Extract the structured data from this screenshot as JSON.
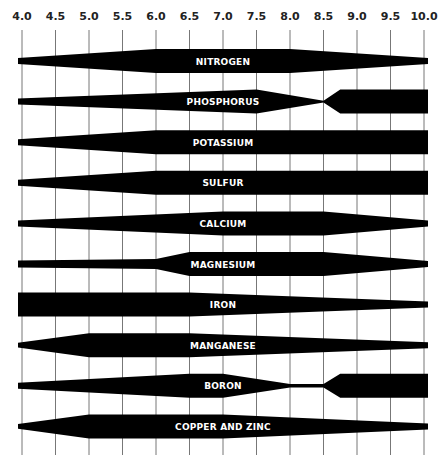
{
  "chart_data": {
    "type": "band",
    "title": "",
    "xlabel": "pH",
    "ylabel": "",
    "x_ticks": [
      "4.0",
      "4.5",
      "5.0",
      "5.5",
      "6.0",
      "6.5",
      "7.0",
      "7.5",
      "8.0",
      "8.5",
      "9.0",
      "9.5",
      "10.0"
    ],
    "xlim": [
      4.0,
      10.0
    ],
    "grid": true,
    "series": [
      {
        "name": "NITROGEN",
        "points": [
          [
            4.0,
            0.25
          ],
          [
            6.0,
            1.0
          ],
          [
            8.0,
            1.0
          ],
          [
            10.0,
            0.25
          ]
        ],
        "end_style": "tapered"
      },
      {
        "name": "PHOSPHORUS",
        "points": [
          [
            4.0,
            0.25
          ],
          [
            7.5,
            1.0
          ],
          [
            8.5,
            0.08
          ],
          [
            8.75,
            1.0
          ],
          [
            10.0,
            1.0
          ]
        ],
        "end_style": "square_right"
      },
      {
        "name": "POTASSIUM",
        "points": [
          [
            4.0,
            0.25
          ],
          [
            6.0,
            1.0
          ],
          [
            10.0,
            1.0
          ]
        ],
        "end_style": "square_right"
      },
      {
        "name": "SULFUR",
        "points": [
          [
            4.0,
            0.25
          ],
          [
            6.0,
            1.0
          ],
          [
            10.0,
            1.0
          ]
        ],
        "end_style": "square_right"
      },
      {
        "name": "CALCIUM",
        "points": [
          [
            4.0,
            0.25
          ],
          [
            7.0,
            1.0
          ],
          [
            8.5,
            1.0
          ],
          [
            10.0,
            0.25
          ]
        ],
        "end_style": "tapered"
      },
      {
        "name": "MAGNESIUM",
        "points": [
          [
            4.0,
            0.3
          ],
          [
            6.0,
            0.42
          ],
          [
            6.5,
            1.0
          ],
          [
            8.5,
            1.0
          ],
          [
            10.0,
            0.25
          ]
        ],
        "end_style": "tapered"
      },
      {
        "name": "IRON",
        "points": [
          [
            4.0,
            1.0
          ],
          [
            6.5,
            1.0
          ],
          [
            10.0,
            0.25
          ]
        ],
        "end_style": "square_left"
      },
      {
        "name": "MANGANESE",
        "points": [
          [
            4.0,
            0.2
          ],
          [
            5.0,
            1.0
          ],
          [
            6.5,
            1.0
          ],
          [
            10.0,
            0.25
          ]
        ],
        "end_style": "tapered"
      },
      {
        "name": "BORON",
        "points": [
          [
            4.0,
            0.25
          ],
          [
            6.5,
            1.0
          ],
          [
            7.0,
            1.0
          ],
          [
            8.0,
            0.15
          ],
          [
            8.5,
            0.15
          ],
          [
            8.75,
            1.0
          ],
          [
            10.0,
            1.0
          ]
        ],
        "end_style": "square_right"
      },
      {
        "name": "COPPER AND ZINC",
        "points": [
          [
            4.0,
            0.2
          ],
          [
            5.0,
            1.0
          ],
          [
            7.0,
            1.0
          ],
          [
            10.0,
            0.25
          ]
        ],
        "end_style": "tapered"
      }
    ]
  },
  "layout": {
    "x0": 22,
    "x1": 424,
    "band_left": 18,
    "band_right": 428,
    "first_center": 61,
    "row_step": 40.6,
    "half_max": 12,
    "grid_top": 30,
    "grid_bottom": 455,
    "tick_label_y": 20
  }
}
